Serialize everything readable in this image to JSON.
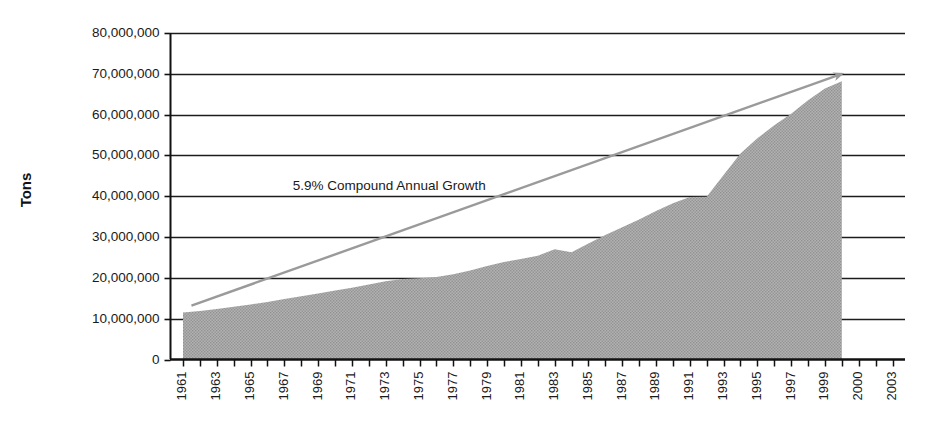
{
  "chart_data": {
    "type": "area",
    "title": "",
    "subtitle": "",
    "xlabel": "",
    "ylabel": "Tons",
    "xlim": [
      1961,
      2003
    ],
    "ylim": [
      0,
      80000000
    ],
    "grid": true,
    "grid_axis": "y",
    "legend": false,
    "legend_position": "none",
    "y_ticks": [
      0,
      10000000,
      20000000,
      30000000,
      40000000,
      50000000,
      60000000,
      70000000,
      80000000
    ],
    "y_tick_labels": [
      "0",
      "10,000,000",
      "20,000,000",
      "30,000,000",
      "40,000,000",
      "50,000,000",
      "60,000,000",
      "70,000,000",
      "80,000,000"
    ],
    "x_tick_labels": [
      "1961",
      "1963",
      "1965",
      "1967",
      "1969",
      "1971",
      "1973",
      "1975",
      "1977",
      "1979",
      "1981",
      "1983",
      "1985",
      "1987",
      "1989",
      "1991",
      "1993",
      "1995",
      "1997",
      "1999",
      "2000",
      "2003"
    ],
    "annotations": [
      {
        "text": "5.9% Compound Annual Growth",
        "x": 1967.5,
        "y": 42500000,
        "kind": "trend-label"
      }
    ],
    "series": [
      {
        "name": "Tons",
        "kind": "area",
        "fill_color": "#a9a9a9",
        "x": [
          1961,
          1962,
          1963,
          1964,
          1965,
          1966,
          1967,
          1968,
          1969,
          1970,
          1971,
          1972,
          1973,
          1974,
          1975,
          1976,
          1977,
          1978,
          1979,
          1980,
          1981,
          1982,
          1983,
          1984,
          1985,
          1986,
          1987,
          1988,
          1989,
          1990,
          1991,
          1992,
          1993,
          1994,
          1995,
          1996,
          1997,
          1998,
          1999,
          2000
        ],
        "values": [
          11500000,
          11900000,
          12400000,
          12900000,
          13500000,
          14100000,
          14800000,
          15500000,
          16200000,
          16900000,
          17600000,
          18400000,
          19200000,
          19700000,
          19900000,
          20200000,
          20900000,
          21800000,
          22900000,
          23900000,
          24600000,
          25400000,
          27000000,
          26300000,
          28400000,
          30500000,
          32400000,
          34300000,
          36400000,
          38300000,
          39800000,
          39900000,
          45200000,
          50500000,
          54200000,
          57400000,
          60200000,
          63500000,
          66400000,
          68200000
        ]
      },
      {
        "name": "5.9% Compound Annual Growth trend",
        "kind": "arrow-line",
        "line_color": "#9a9a9a",
        "start": {
          "x": 1961.5,
          "y": 13200000
        },
        "end": {
          "x": 2000.0,
          "y": 70000000
        },
        "arrowhead": "end"
      }
    ]
  },
  "axis": {
    "y_title": "Tons"
  }
}
